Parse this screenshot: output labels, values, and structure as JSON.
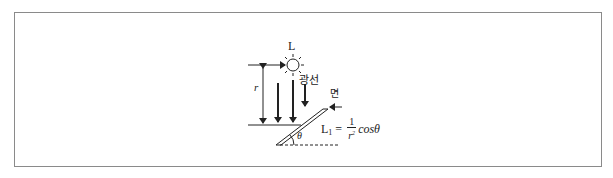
{
  "diagram": {
    "labels": {
      "source": "L",
      "distance": "r",
      "rays": "광선",
      "surface": "면",
      "angle": "θ"
    },
    "formula": {
      "lhs": "L",
      "lhs_sub": "1",
      "equals": "=",
      "numerator": "1",
      "denominator": "r",
      "denominator_exp": "2",
      "trig": "cosθ"
    },
    "elements": {
      "light_source": "sun-icon",
      "ray_count": 3,
      "distance_arrow": "double-headed vertical arrow",
      "surface": "inclined plane at angle θ to horizontal",
      "baseline": "dashed horizontal line"
    },
    "colors": {
      "line": "#222222",
      "frame": "#8a8a8a",
      "background": "#ffffff"
    }
  }
}
